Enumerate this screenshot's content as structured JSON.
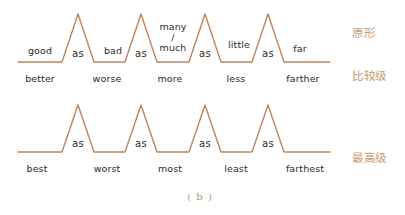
{
  "figure": {
    "caption": "( b )",
    "line_color": "#c0845a",
    "label_color": "#2e2b28",
    "side_label_color": "#c89a72",
    "background": "#ffffff"
  },
  "side_labels": [
    {
      "text": "原形",
      "x": 352,
      "y": 33
    },
    {
      "text": "比较级",
      "x": 352,
      "y": 76
    },
    {
      "text": "最高级",
      "x": 352,
      "y": 158
    }
  ],
  "rows": [
    {
      "name": "row-positive-comparative",
      "baseline_y": 62,
      "peak_y": 14,
      "peaks_x": [
        78,
        141,
        205,
        268
      ],
      "line_start_x": 18,
      "line_end_x": 330,
      "top_labels": [
        {
          "text": "good",
          "x": 40,
          "y": 50,
          "multiline": false
        },
        {
          "text": "as",
          "x": 78,
          "y": 53,
          "as": true
        },
        {
          "text": "bad",
          "x": 113,
          "y": 50,
          "multiline": false
        },
        {
          "text": "as",
          "x": 141,
          "y": 53,
          "as": true
        },
        {
          "text": "many / much",
          "x": 173,
          "y": 38,
          "multiline": true
        },
        {
          "text": "as",
          "x": 205,
          "y": 53,
          "as": true
        },
        {
          "text": "little",
          "x": 239,
          "y": 44,
          "multiline": false
        },
        {
          "text": "as",
          "x": 268,
          "y": 53,
          "as": true
        },
        {
          "text": "far",
          "x": 300,
          "y": 48,
          "multiline": false
        }
      ],
      "bottom_labels": [
        {
          "text": "better",
          "x": 40,
          "y": 78
        },
        {
          "text": "worse",
          "x": 107,
          "y": 78
        },
        {
          "text": "more",
          "x": 170,
          "y": 78
        },
        {
          "text": "less",
          "x": 236,
          "y": 78
        },
        {
          "text": "farther",
          "x": 303,
          "y": 78
        }
      ]
    },
    {
      "name": "row-superlative",
      "baseline_y": 152,
      "peak_y": 105,
      "peaks_x": [
        78,
        141,
        205,
        268
      ],
      "line_start_x": 18,
      "line_end_x": 330,
      "top_labels": [
        {
          "text": "as",
          "x": 78,
          "y": 143,
          "as": true
        },
        {
          "text": "as",
          "x": 141,
          "y": 143,
          "as": true
        },
        {
          "text": "as",
          "x": 205,
          "y": 143,
          "as": true
        },
        {
          "text": "as",
          "x": 268,
          "y": 143,
          "as": true
        }
      ],
      "bottom_labels": [
        {
          "text": "best",
          "x": 37,
          "y": 168
        },
        {
          "text": "worst",
          "x": 107,
          "y": 168
        },
        {
          "text": "most",
          "x": 170,
          "y": 168
        },
        {
          "text": "least",
          "x": 236,
          "y": 168
        },
        {
          "text": "farthest",
          "x": 305,
          "y": 168
        }
      ]
    }
  ],
  "caption_position": {
    "x": 200,
    "y": 196
  }
}
